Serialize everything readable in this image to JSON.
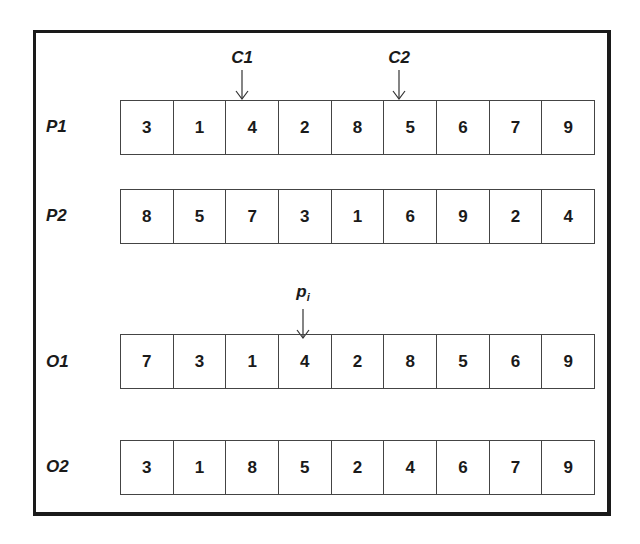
{
  "diagram": {
    "pointers": {
      "c1": {
        "label": "C1"
      },
      "c2": {
        "label": "C2"
      },
      "pi": {
        "label": "p",
        "subscript": "i"
      }
    },
    "rows": [
      {
        "label": "P1",
        "values": [
          "3",
          "1",
          "4",
          "2",
          "8",
          "5",
          "6",
          "7",
          "9"
        ]
      },
      {
        "label": "P2",
        "values": [
          "8",
          "5",
          "7",
          "3",
          "1",
          "6",
          "9",
          "2",
          "4"
        ]
      },
      {
        "label": "O1",
        "values": [
          "7",
          "3",
          "1",
          "4",
          "2",
          "8",
          "5",
          "6",
          "9"
        ]
      },
      {
        "label": "O2",
        "values": [
          "3",
          "1",
          "8",
          "5",
          "2",
          "4",
          "6",
          "7",
          "9"
        ]
      }
    ]
  }
}
